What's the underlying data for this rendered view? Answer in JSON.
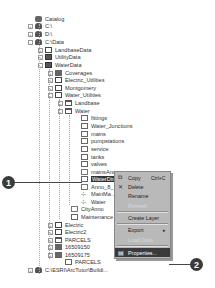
{
  "tree": {
    "items": [
      {
        "label": "Catalog",
        "icon": "catalog-icon",
        "x": 36,
        "y": 19,
        "expander": ""
      },
      {
        "label": "C:\\",
        "icon": "drive-icon",
        "x": 36,
        "y": 26,
        "expander": "+"
      },
      {
        "label": "D:\\",
        "icon": "drive-icon",
        "x": 36,
        "y": 34,
        "expander": "+"
      },
      {
        "label": "C:\\Data",
        "icon": "folder-connection-icon",
        "x": 36,
        "y": 42,
        "expander": "-"
      },
      {
        "label": "LandbaseData",
        "icon": "geodatabase-icon",
        "x": 46,
        "y": 50,
        "expander": "+"
      },
      {
        "label": "UtilityData",
        "icon": "folder-icon",
        "x": 46,
        "y": 57,
        "expander": "+"
      },
      {
        "label": "WaterData",
        "icon": "folder-icon",
        "x": 46,
        "y": 65,
        "expander": "-"
      },
      {
        "label": "Coverages",
        "icon": "coverage-folder-icon",
        "x": 56,
        "y": 73,
        "expander": "+"
      },
      {
        "label": "Electric_Utilities",
        "icon": "geodatabase-icon",
        "x": 56,
        "y": 80,
        "expander": "+"
      },
      {
        "label": "Montgomery",
        "icon": "geodatabase-icon",
        "x": 56,
        "y": 88,
        "expander": "+"
      },
      {
        "label": "Water_Utilities",
        "icon": "geodatabase-icon",
        "x": 56,
        "y": 95,
        "expander": "-"
      },
      {
        "label": "Landbase",
        "icon": "feature-dataset-icon",
        "x": 66,
        "y": 103,
        "expander": "+"
      },
      {
        "label": "Water",
        "icon": "feature-dataset-icon",
        "x": 66,
        "y": 111,
        "expander": "-"
      },
      {
        "label": "fittings",
        "icon": "feature-class-icon",
        "x": 82,
        "y": 118,
        "expander": ""
      },
      {
        "label": "Water_Junctions",
        "icon": "feature-class-icon",
        "x": 82,
        "y": 126,
        "expander": ""
      },
      {
        "label": "mains",
        "icon": "feature-class-icon",
        "x": 82,
        "y": 134,
        "expander": ""
      },
      {
        "label": "pumpstations",
        "icon": "feature-class-icon",
        "x": 82,
        "y": 141,
        "expander": ""
      },
      {
        "label": "service",
        "icon": "feature-class-icon",
        "x": 82,
        "y": 149,
        "expander": ""
      },
      {
        "label": "tanks",
        "icon": "feature-class-icon",
        "x": 82,
        "y": 157,
        "expander": ""
      },
      {
        "label": "valves",
        "icon": "feature-class-icon",
        "x": 82,
        "y": 164,
        "expander": ""
      },
      {
        "label": "mainsAnno",
        "icon": "annotation-class-icon",
        "x": 82,
        "y": 172,
        "expander": ""
      },
      {
        "label": "WaterDims",
        "icon": "dimension-class-icon",
        "x": 82,
        "y": 179,
        "expander": "",
        "selected": true
      },
      {
        "label": "Anno_8_...",
        "icon": "annotation-class-icon",
        "x": 82,
        "y": 187,
        "expander": ""
      },
      {
        "label": "MainMa...",
        "icon": "relationship-class-icon",
        "x": 82,
        "y": 194,
        "expander": ""
      },
      {
        "label": "Water",
        "icon": "geometric-network-icon",
        "x": 82,
        "y": 202,
        "expander": ""
      },
      {
        "label": "CityAnno",
        "icon": "annotation-class-icon",
        "x": 72,
        "y": 209,
        "expander": ""
      },
      {
        "label": "Maintenance",
        "icon": "table-icon",
        "x": 72,
        "y": 217,
        "expander": ""
      },
      {
        "label": "Electric",
        "icon": "geodatabase-icon",
        "x": 56,
        "y": 225,
        "expander": "+"
      },
      {
        "label": "Electric2",
        "icon": "geodatabase-icon",
        "x": 56,
        "y": 232,
        "expander": "+"
      },
      {
        "label": "PARCELS",
        "icon": "coverage-icon",
        "x": 56,
        "y": 240,
        "expander": "+"
      },
      {
        "label": "16509150",
        "icon": "raster-icon",
        "x": 56,
        "y": 247,
        "expander": "+"
      },
      {
        "label": "16509175",
        "icon": "raster-icon",
        "x": 56,
        "y": 255,
        "expander": "+"
      },
      {
        "label": "PARCELS",
        "icon": "shapefile-icon",
        "x": 66,
        "y": 262,
        "expander": ""
      },
      {
        "label": "C:\\ESRI\\ArcTutor\\Buildi...",
        "icon": "folder-connection-icon",
        "x": 36,
        "y": 270,
        "expander": "+"
      }
    ]
  },
  "context_menu": {
    "items": [
      {
        "label": "Copy",
        "shortcut": "Ctrl+C",
        "icon": "copy-icon",
        "y": 1,
        "disabled": false
      },
      {
        "label": "Delete",
        "shortcut": "",
        "icon": "delete-icon",
        "y": 10,
        "disabled": false
      },
      {
        "label": "Rename",
        "shortcut": "",
        "icon": "",
        "y": 19,
        "disabled": false
      },
      {
        "label": "Refresh",
        "shortcut": "",
        "icon": "",
        "y": 29,
        "disabled": true
      },
      {
        "label": "Create Layer",
        "shortcut": "",
        "icon": "",
        "y": 41,
        "disabled": false
      },
      {
        "label": "Export",
        "shortcut": "",
        "icon": "",
        "y": 53,
        "disabled": false,
        "submenu": true
      },
      {
        "label": "Load Data",
        "shortcut": "",
        "icon": "",
        "y": 63,
        "disabled": true
      },
      {
        "label": "Properties...",
        "shortcut": "",
        "icon": "properties-icon",
        "y": 76,
        "disabled": false,
        "highlighted": true
      }
    ],
    "separators_y": [
      39,
      51,
      73
    ]
  },
  "callouts": [
    {
      "number": "1",
      "target": "WaterDims"
    },
    {
      "number": "2",
      "target": "Properties..."
    }
  ],
  "colors": {
    "highlight": "#3a3a3a",
    "menu_bg": "#b9b9b9",
    "callout": "#3b3b3b"
  }
}
